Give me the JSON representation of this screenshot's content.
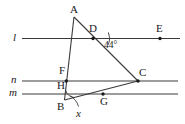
{
  "figure": {
    "type": "geometry-diagram",
    "background_color": "#ffffff",
    "stroke_color": "#3a3a3a",
    "label_color": "#1a1a1a",
    "width": 185,
    "height": 124
  },
  "lines": [
    {
      "name": "l",
      "label": "l",
      "y": 38.5,
      "x1": 22,
      "x2": 180
    },
    {
      "name": "n",
      "label": "n",
      "y": 81.0,
      "x1": 22,
      "x2": 178
    },
    {
      "name": "m",
      "label": "m",
      "y": 94.0,
      "x1": 22,
      "x2": 178
    }
  ],
  "line_labels": [
    {
      "name": "line-label-l",
      "text": "l",
      "x": 13,
      "y": 33
    },
    {
      "name": "line-label-n",
      "text": "n",
      "x": 12,
      "y": 75.5
    },
    {
      "name": "line-label-m",
      "text": "m",
      "x": 10,
      "y": 88.5
    }
  ],
  "points": [
    {
      "name": "A",
      "label": "A",
      "x": 74.0,
      "y": 17.0,
      "dot": false,
      "lx": 70.0,
      "ly": 5.0
    },
    {
      "name": "D",
      "label": "D",
      "x": 93.0,
      "y": 38.5,
      "dot": true,
      "lx": 90.0,
      "ly": 24.0
    },
    {
      "name": "E",
      "label": "E",
      "x": 160.0,
      "y": 38.5,
      "dot": true,
      "lx": 156.0,
      "ly": 24.0
    },
    {
      "name": "F",
      "label": "F",
      "x": 68.0,
      "y": 73.0,
      "dot": false,
      "lx": 60.0,
      "ly": 66.0
    },
    {
      "name": "C",
      "label": "C",
      "x": 138.0,
      "y": 81.0,
      "dot": true,
      "lx": 139.0,
      "ly": 68.0
    },
    {
      "name": "H",
      "label": "H",
      "x": 66.3,
      "y": 81.0,
      "dot": true,
      "lx": 58.0,
      "ly": 80.0
    },
    {
      "name": "G",
      "label": "G",
      "x": 103.0,
      "y": 94.0,
      "dot": true,
      "lx": 100.0,
      "ly": 96.5
    },
    {
      "name": "B",
      "label": "B",
      "x": 64.5,
      "y": 100.0,
      "dot": false,
      "lx": 58.0,
      "ly": 101.0
    }
  ],
  "segments": [
    {
      "name": "segment-AB",
      "from": "A",
      "to": "B"
    },
    {
      "name": "segment-AC",
      "from": "A",
      "to": "C"
    },
    {
      "name": "segment-BC",
      "from": "B",
      "to": "C"
    }
  ],
  "angles": [
    {
      "name": "angle-at-D",
      "vertex": "D",
      "label": "44°",
      "value": 44,
      "unit": "degrees",
      "label_x": 104.0,
      "label_y": 42.0,
      "arc_radius": 13.0,
      "arc_start_deg": 0,
      "arc_end_deg": 44
    },
    {
      "name": "angle-at-B",
      "vertex": "B",
      "label": "x",
      "value": null,
      "unknown": true,
      "label_x": 78.0,
      "label_y": 112.0,
      "arc_radius": 10.0
    }
  ],
  "labels": {
    "angle_known": "44°",
    "angle_unknown": "x",
    "vertex_a": "A",
    "vertex_b": "B",
    "vertex_c": "C",
    "point_d": "D",
    "point_e": "E",
    "point_f": "F",
    "point_g": "G",
    "point_h": "H",
    "line_l": "l",
    "line_n": "n",
    "line_m": "m"
  }
}
